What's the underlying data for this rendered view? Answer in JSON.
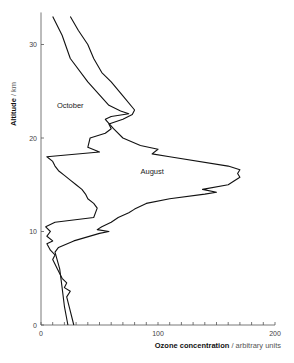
{
  "chart_data": {
    "type": "line",
    "title": "",
    "xlabel_bold": "Ozone concentration",
    "xlabel_rest": " / arbitrary units",
    "ylabel_bold": "Altitude",
    "ylabel_rest": " / km",
    "xlim": [
      0,
      200
    ],
    "ylim": [
      0,
      33
    ],
    "x_ticks": [
      0,
      100,
      200
    ],
    "y_ticks": [
      0,
      10,
      20,
      30
    ],
    "series": [
      {
        "name": "August",
        "label_pos": [
          95,
          16.2
        ],
        "points": [
          [
            23,
            0
          ],
          [
            20,
            2
          ],
          [
            18,
            4
          ],
          [
            16,
            6
          ],
          [
            12,
            7.8
          ],
          [
            15,
            8.3
          ],
          [
            28,
            9
          ],
          [
            50,
            9.8
          ],
          [
            58,
            10
          ],
          [
            48,
            10.2
          ],
          [
            52,
            10.5
          ],
          [
            60,
            11
          ],
          [
            66,
            11.5
          ],
          [
            75,
            12
          ],
          [
            80,
            12.4
          ],
          [
            90,
            13
          ],
          [
            110,
            13.5
          ],
          [
            140,
            14
          ],
          [
            150,
            14.2
          ],
          [
            138,
            14.5
          ],
          [
            160,
            15
          ],
          [
            165,
            15.4
          ],
          [
            170,
            15.8
          ],
          [
            168,
            16.2
          ],
          [
            170,
            16.6
          ],
          [
            160,
            17
          ],
          [
            110,
            18
          ],
          [
            95,
            18.3
          ],
          [
            100,
            18.8
          ],
          [
            85,
            19.2
          ],
          [
            70,
            20
          ],
          [
            62,
            21
          ],
          [
            55,
            22
          ],
          [
            60,
            22.3
          ],
          [
            75,
            22.6
          ],
          [
            68,
            22.9
          ],
          [
            58,
            23.5
          ],
          [
            40,
            26
          ],
          [
            25,
            28.5
          ],
          [
            18,
            31
          ],
          [
            10,
            33
          ]
        ]
      },
      {
        "name": "October",
        "label_pos": [
          25,
          23.2
        ],
        "points": [
          [
            28,
            0
          ],
          [
            24,
            2
          ],
          [
            22,
            3
          ],
          [
            25,
            3.6
          ],
          [
            20,
            4
          ],
          [
            22,
            4.5
          ],
          [
            18,
            5
          ],
          [
            14,
            6
          ],
          [
            10,
            7
          ],
          [
            12,
            7.5
          ],
          [
            8,
            8
          ],
          [
            5,
            8.7
          ],
          [
            10,
            9
          ],
          [
            5,
            9.5
          ],
          [
            8,
            10
          ],
          [
            4,
            10.5
          ],
          [
            12,
            11
          ],
          [
            45,
            11.5
          ],
          [
            48,
            12.5
          ],
          [
            45,
            13
          ],
          [
            40,
            13.5
          ],
          [
            38,
            14
          ],
          [
            35,
            14.5
          ],
          [
            30,
            15
          ],
          [
            25,
            15.5
          ],
          [
            20,
            16
          ],
          [
            15,
            16.5
          ],
          [
            12,
            17
          ],
          [
            10,
            17.5
          ],
          [
            5,
            18
          ],
          [
            50,
            18.5
          ],
          [
            40,
            19
          ],
          [
            42,
            20
          ],
          [
            55,
            20.5
          ],
          [
            60,
            21
          ],
          [
            58,
            21.5
          ],
          [
            70,
            22
          ],
          [
            78,
            22.5
          ],
          [
            80,
            23
          ],
          [
            70,
            24.5
          ],
          [
            60,
            26
          ],
          [
            52,
            27
          ],
          [
            45,
            28.5
          ],
          [
            40,
            30
          ],
          [
            32,
            31.5
          ],
          [
            25,
            33
          ]
        ]
      }
    ]
  }
}
